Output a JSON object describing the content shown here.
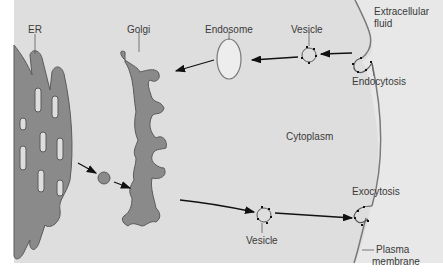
{
  "diagram": {
    "labels": {
      "er": "ER",
      "golgi": "Golgi",
      "endosome": "Endosome",
      "vesicle_top": "Vesicle",
      "extracellular_1": "Extracellular",
      "extracellular_2": "fluid",
      "endocytosis": "Endocytosis",
      "cytoplasm": "Cytoplasm",
      "exocytosis": "Exocytosis",
      "vesicle_bottom": "Vesicle",
      "plasma_1": "Plasma",
      "plasma_2": "membrane"
    },
    "colors": {
      "background": "#ffffff",
      "cytoplasm": "#dedede",
      "extracellular": "#e6e6e6",
      "organelle_fill": "#8a8a8a",
      "organelle_stroke": "#5a5a5a",
      "membrane": "#7a7a7a",
      "arrow": "#111111",
      "label": "#3a3a3a"
    }
  }
}
